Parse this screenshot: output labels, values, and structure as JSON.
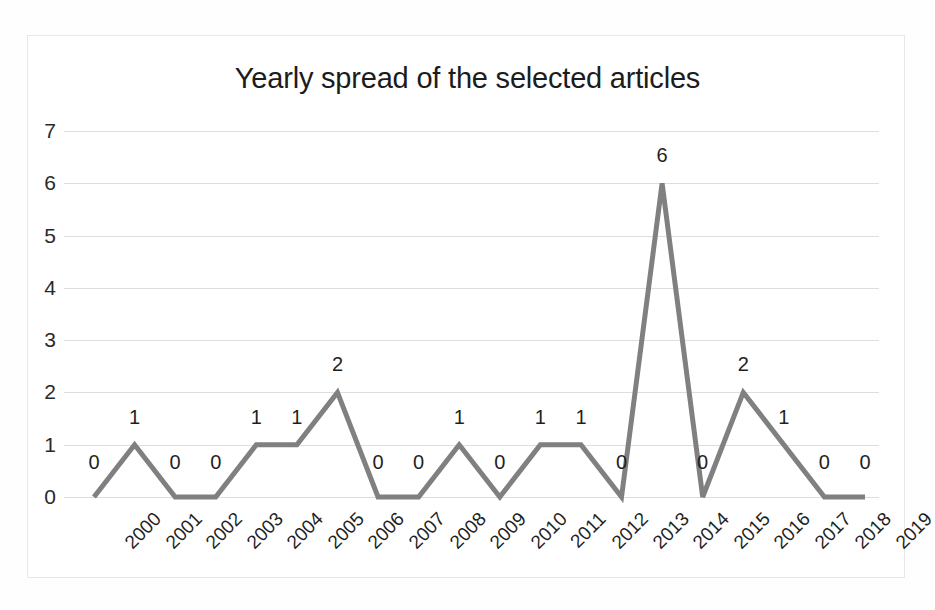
{
  "chart_data": {
    "type": "line",
    "title": "Yearly spread of the selected articles",
    "xlabel": "",
    "ylabel": "",
    "categories": [
      "2000",
      "2001",
      "2002",
      "2003",
      "2004",
      "2005",
      "2006",
      "2007",
      "2008",
      "2009",
      "2010",
      "2011",
      "2012",
      "2013",
      "2014",
      "2015",
      "2016",
      "2017",
      "2018",
      "2019"
    ],
    "values": [
      0,
      1,
      0,
      0,
      1,
      1,
      2,
      0,
      0,
      1,
      0,
      1,
      1,
      0,
      6,
      0,
      2,
      1,
      0,
      0
    ],
    "data_labels": [
      "0",
      "1",
      "0",
      "0",
      "1",
      "1",
      "2",
      "0",
      "0",
      "1",
      "0",
      "1",
      "1",
      "0",
      "6",
      "0",
      "2",
      "1",
      "0",
      "0"
    ],
    "yticks": [
      0,
      1,
      2,
      3,
      4,
      5,
      6,
      7
    ],
    "ytick_labels": [
      "0",
      "1",
      "2",
      "3",
      "4",
      "5",
      "6",
      "7"
    ],
    "ylim": [
      0,
      7
    ],
    "grid": true,
    "legend": false,
    "series_color": "#808080",
    "gridline_color": "#dedede",
    "text_color": "#1f1f1f",
    "background": "#ffffff"
  }
}
